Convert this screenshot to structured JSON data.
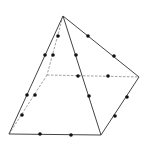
{
  "diagram": {
    "type": "pyramid-with-edge-points",
    "colors": {
      "solid_edge": "#444444",
      "hidden_edge": "#888888",
      "point": "#111111",
      "background": "#ffffff"
    },
    "vertices": {
      "apex": [
        63,
        16
      ],
      "base_front_left": [
        9,
        134
      ],
      "base_front_right": [
        101,
        135
      ],
      "base_right": [
        139,
        77
      ],
      "base_back_left": [
        47,
        75
      ]
    },
    "solid_edges": [
      [
        "apex",
        "base_front_left"
      ],
      [
        "apex",
        "base_front_right"
      ],
      [
        "apex",
        "base_right"
      ],
      [
        "base_front_left",
        "base_front_right"
      ],
      [
        "base_front_right",
        "base_right"
      ]
    ],
    "hidden_edges": [
      [
        "apex",
        "base_back_left"
      ],
      [
        "base_back_left",
        "base_front_left"
      ],
      [
        "base_back_left",
        "base_right"
      ]
    ],
    "points": [
      [
        58,
        36
      ],
      [
        45,
        55
      ],
      [
        53,
        55
      ],
      [
        88,
        36
      ],
      [
        114,
        56
      ],
      [
        76,
        55
      ],
      [
        89,
        96
      ],
      [
        78,
        76
      ],
      [
        108,
        76
      ],
      [
        127,
        97
      ],
      [
        115,
        116
      ],
      [
        27,
        95
      ],
      [
        35,
        95
      ],
      [
        22,
        115
      ],
      [
        40,
        134
      ],
      [
        71,
        135
      ]
    ]
  }
}
